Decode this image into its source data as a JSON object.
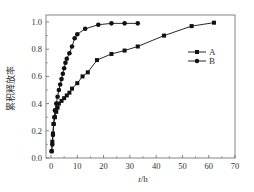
{
  "chart_data": {
    "type": "line",
    "title": "",
    "xlabel": "t/h",
    "ylabel": "累积释放率",
    "xlim": [
      0,
      70
    ],
    "ylim": [
      0.0,
      1.05
    ],
    "xticks": [
      0,
      10,
      20,
      30,
      40,
      50,
      60,
      70
    ],
    "yticks": [
      0.0,
      0.2,
      0.4,
      0.6,
      0.8,
      1.0
    ],
    "xtick_labels": [
      "0",
      "10",
      "20",
      "30",
      "40",
      "50",
      "60",
      "70"
    ],
    "ytick_labels": [
      "0.0",
      "0.2",
      "0.4",
      "0.6",
      "0.8",
      "1.0"
    ],
    "grid": false,
    "legend_position": "right-middle",
    "series": [
      {
        "name": "A",
        "marker": "square",
        "x": [
          0.25,
          0.5,
          0.75,
          1,
          1.5,
          2,
          2.5,
          3,
          4,
          5,
          6,
          7,
          8,
          10,
          12,
          14,
          17.5,
          23,
          28,
          33,
          43,
          53.5,
          62
        ],
        "y": [
          0.05,
          0.12,
          0.18,
          0.25,
          0.3,
          0.34,
          0.37,
          0.4,
          0.42,
          0.44,
          0.46,
          0.48,
          0.51,
          0.55,
          0.6,
          0.63,
          0.72,
          0.765,
          0.79,
          0.82,
          0.9,
          0.97,
          0.995
        ]
      },
      {
        "name": "B",
        "marker": "circle",
        "x": [
          0.25,
          0.5,
          0.75,
          1,
          1.25,
          1.5,
          2,
          2.5,
          3,
          3.5,
          4,
          4.5,
          5,
          5.5,
          6,
          7,
          8,
          9,
          10,
          13,
          18,
          23,
          28,
          33
        ],
        "y": [
          0.05,
          0.1,
          0.17,
          0.25,
          0.3,
          0.35,
          0.4,
          0.45,
          0.5,
          0.54,
          0.58,
          0.62,
          0.66,
          0.7,
          0.73,
          0.77,
          0.82,
          0.88,
          0.91,
          0.95,
          0.98,
          0.99,
          0.99,
          0.99
        ]
      }
    ]
  }
}
